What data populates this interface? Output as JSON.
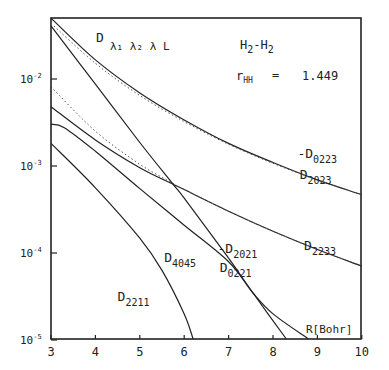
{
  "chart_data": {
    "type": "line",
    "system": "H2-H2",
    "parameter": {
      "label": "r_HH",
      "equals": "=",
      "value": "1.449"
    },
    "xlabel": "R [Bohr]",
    "ylabel": "",
    "yscale": "log",
    "xlim": [
      3,
      10
    ],
    "ylim": [
      1e-05,
      0.05
    ],
    "x_ticks": [
      "3",
      "4",
      "5",
      "6",
      "7",
      "8",
      "9",
      "10"
    ],
    "y_ticks": [
      {
        "label": "10^-2",
        "value": 0.01
      },
      {
        "label": "10^-3",
        "value": 0.001
      },
      {
        "label": "10^-4",
        "value": 0.0001
      },
      {
        "label": "10^-5",
        "value": 1e-05
      }
    ],
    "series": [
      {
        "name": "D2023 (solid)",
        "style": "solid",
        "x": [
          3,
          4,
          5,
          6,
          7,
          8,
          9,
          10
        ],
        "log10y": [
          -1.3,
          -1.78,
          -2.16,
          -2.47,
          -2.74,
          -2.96,
          -3.16,
          -3.33
        ]
      },
      {
        "name": "-D0223 (dotted)",
        "style": "dotted",
        "x": [
          3,
          4,
          5,
          6,
          7,
          8,
          9,
          10
        ],
        "log10y": [
          -1.36,
          -1.82,
          -2.19,
          -2.49,
          -2.75,
          -2.97,
          -3.16,
          -3.33
        ]
      },
      {
        "name": "D2233 (solid)",
        "style": "solid",
        "x": [
          3,
          4,
          5,
          5.75,
          6,
          7,
          8,
          9,
          10
        ],
        "log10y": [
          -2.32,
          -2.7,
          -3.02,
          -3.21,
          -3.27,
          -3.52,
          -3.75,
          -3.96,
          -4.15
        ]
      },
      {
        "name": "D2233 (dotted)",
        "style": "dotted",
        "x": [
          3,
          4,
          5,
          5.75,
          6,
          7,
          8,
          9,
          10
        ],
        "log10y": [
          -2.09,
          -2.6,
          -2.98,
          -3.2,
          -3.27,
          -3.52,
          -3.75,
          -3.96,
          -4.15
        ]
      },
      {
        "name": "D4045",
        "style": "solid",
        "x": [
          3,
          4,
          5,
          5.75,
          6,
          7,
          7.55,
          8.3
        ],
        "log10y": [
          -1.39,
          -2.06,
          -2.73,
          -3.21,
          -3.37,
          -4.06,
          -4.46,
          -5.0
        ]
      },
      {
        "name": "-D2021 / D0221",
        "style": "solid",
        "x": [
          3,
          3.3,
          4,
          5,
          6,
          7,
          7.55,
          8,
          8.8
        ],
        "log10y": [
          -2.52,
          -2.56,
          -2.83,
          -3.26,
          -3.68,
          -4.1,
          -4.46,
          -4.7,
          -5.0
        ]
      },
      {
        "name": "D2211",
        "style": "solid",
        "x": [
          3,
          4,
          5,
          5.5,
          6,
          6.2
        ],
        "log10y": [
          -2.74,
          -3.25,
          -3.83,
          -4.2,
          -4.7,
          -5.0
        ]
      }
    ],
    "annotations": [
      {
        "text": "-D",
        "sub": "0223",
        "x": 8.55,
        "log10y": -2.91
      },
      {
        "text": "D",
        "sub": "2023",
        "x": 8.6,
        "log10y": -3.15
      },
      {
        "text": "D",
        "sub": "2233",
        "x": 8.7,
        "log10y": -3.96
      },
      {
        "text": "D",
        "sub": "4045",
        "x": 5.55,
        "log10y": -4.1
      },
      {
        "text": "-D",
        "sub": "2021",
        "x": 6.75,
        "log10y": -4.0
      },
      {
        "text": "D",
        "sub": "0221",
        "x": 6.8,
        "log10y": -4.22
      },
      {
        "text": "D",
        "sub": "2211",
        "x": 4.5,
        "log10y": -4.55
      }
    ]
  },
  "labels": {
    "title_main": "D",
    "title_subs": "λ₁ λ₂ λ L",
    "system_a": "H",
    "system_sub1": "2",
    "system_dash": "-H",
    "system_sub2": "2",
    "param_r": "r",
    "param_sub": "HH",
    "param_eq": "=",
    "param_val": "1.449",
    "xlabel": "R[Bohr]",
    "ytick_base": "10",
    "x_ticks": [
      "3",
      "4",
      "5",
      "6",
      "7",
      "8",
      "9",
      "10"
    ],
    "y_exps": [
      "-2",
      "-3",
      "-4",
      "-5"
    ],
    "ann": [
      {
        "pre": "-D",
        "sub": "0223"
      },
      {
        "pre": "D",
        "sub": "2023"
      },
      {
        "pre": "D",
        "sub": "2233"
      },
      {
        "pre": "D",
        "sub": "4045"
      },
      {
        "pre": "-D",
        "sub": "2021"
      },
      {
        "pre": "D",
        "sub": "0221"
      },
      {
        "pre": "D",
        "sub": "2211"
      }
    ]
  }
}
